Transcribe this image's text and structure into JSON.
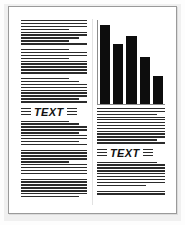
{
  "document": {
    "title": "Two-column newsletter page thumbnail",
    "background_color": "#f0f0f0",
    "page_color": "#ffffff",
    "frame_color": "#9a9a9a",
    "rule_color": "#2b2b2b"
  },
  "left_column": {
    "name": "left-text-column",
    "headline": "TEXT",
    "lines_above_headline": 27,
    "lines_below_headline": 25
  },
  "right_column": {
    "name": "right-text-column",
    "headline": "TEXT",
    "strip_lines": 4,
    "lines_above_headline": 9,
    "lines_below_headline": 11
  },
  "chart_data": {
    "type": "bar",
    "title": "",
    "xlabel": "",
    "ylabel": "",
    "categories": [
      "1",
      "2",
      "3",
      "4",
      "5"
    ],
    "values": [
      95,
      72,
      82,
      56,
      34
    ],
    "ylim": [
      0,
      100
    ],
    "grid": false,
    "legend": false,
    "bar_color": "#0d0d0d",
    "axis_color": "#8c8c8c"
  }
}
